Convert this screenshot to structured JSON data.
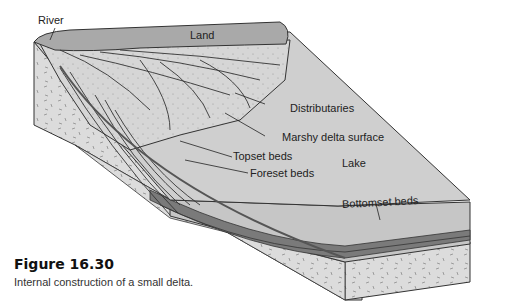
{
  "diagram": {
    "labels": {
      "river": "River",
      "land": "Land",
      "distributaries": "Distributaries",
      "marshy": "Marshy delta surface",
      "topset": "Topset beds",
      "foreset": "Foreset beds",
      "lake": "Lake",
      "bottomset": "Bottomset beds"
    },
    "colors": {
      "land": "#a9a9a9",
      "lake_surface": "#cfcfcf",
      "lake_side": "#c4c4c4",
      "bedrock": "#d9d9d9",
      "beds": "#7a7a7a",
      "outline": "#333333"
    }
  },
  "figure": {
    "title": "Figure 16.30",
    "caption": "Internal construction of a small delta."
  }
}
